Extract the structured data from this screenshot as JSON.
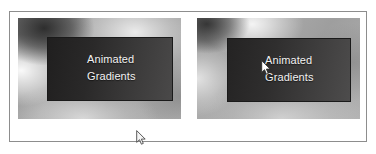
{
  "window": {
    "background_color": "#ffffff",
    "frame_border_color": "#8d8d8d"
  },
  "panels": [
    {
      "id": "panel-left",
      "name": "animated-gradient-preview-left",
      "caption_line_1": "Animated",
      "caption_line_2": "Gradients",
      "caption_color": "#f2f2f2",
      "box_background": "#2a2929",
      "gradient_base_color": "#9c9c9c",
      "cursor_visible": true
    },
    {
      "id": "panel-right",
      "name": "animated-gradient-preview-right",
      "caption_line_1": "Animated",
      "caption_line_2": "Gradients",
      "caption_color": "#f2f2f2",
      "box_background": "#2f2e2e",
      "gradient_base_color": "#9e9e9e",
      "cursor_visible": true
    }
  ],
  "cursors": [
    {
      "name": "mouse-cursor-left",
      "x": 126,
      "y": 118,
      "target": "panel-left-below-gradient"
    },
    {
      "name": "mouse-cursor-right",
      "x": 64,
      "y": 42,
      "target": "panel-right-caption"
    }
  ]
}
